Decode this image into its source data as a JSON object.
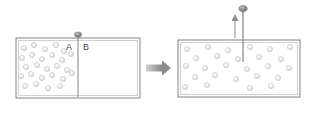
{
  "diagram": {
    "type": "physics-illustration",
    "colors": {
      "box_border": "#8d8d8d",
      "box_inner_border": "#c9c9c9",
      "box_fill": "#ffffff",
      "particle_fill": "#e8e8e8",
      "particle_stroke": "#b0b0b0",
      "divider": "#8d8d8d",
      "knob": "#8a8a8a",
      "arrow": "#9a9a9a",
      "label_text": "#4a4a4a"
    },
    "panels": [
      {
        "id": "before",
        "name": "initial-state",
        "box": {
          "x": 16,
          "y": 38,
          "width": 124,
          "height": 60
        },
        "compartments": [
          {
            "label": "A",
            "label_x": 66,
            "label_y": 43,
            "state": "gas",
            "particle_count": 26
          },
          {
            "label": "B",
            "label_x": 83,
            "label_y": 43,
            "state": "vacuum",
            "particle_count": 0
          }
        ],
        "divider": {
          "x": 78,
          "y_top": 38,
          "y_bottom": 98,
          "knob_x": 78,
          "knob_y": 34
        },
        "particles": [
          {
            "x": 24,
            "y": 48
          },
          {
            "x": 34,
            "y": 45
          },
          {
            "x": 45,
            "y": 49
          },
          {
            "x": 56,
            "y": 45
          },
          {
            "x": 64,
            "y": 51
          },
          {
            "x": 22,
            "y": 58
          },
          {
            "x": 32,
            "y": 55
          },
          {
            "x": 42,
            "y": 59
          },
          {
            "x": 52,
            "y": 55
          },
          {
            "x": 62,
            "y": 60
          },
          {
            "x": 71,
            "y": 54
          },
          {
            "x": 26,
            "y": 67
          },
          {
            "x": 37,
            "y": 65
          },
          {
            "x": 47,
            "y": 69
          },
          {
            "x": 57,
            "y": 66
          },
          {
            "x": 67,
            "y": 70
          },
          {
            "x": 21,
            "y": 76
          },
          {
            "x": 31,
            "y": 74
          },
          {
            "x": 42,
            "y": 78
          },
          {
            "x": 52,
            "y": 75
          },
          {
            "x": 63,
            "y": 79
          },
          {
            "x": 72,
            "y": 73
          },
          {
            "x": 25,
            "y": 86
          },
          {
            "x": 36,
            "y": 84
          },
          {
            "x": 48,
            "y": 88
          },
          {
            "x": 60,
            "y": 86
          }
        ]
      },
      {
        "id": "after",
        "name": "final-state",
        "box": {
          "x": 178,
          "y": 40,
          "width": 122,
          "height": 57
        },
        "compartments": [
          {
            "label": "",
            "state": "gas",
            "particle_count": 26
          }
        ],
        "divider": {
          "x": 243,
          "y_top": 12,
          "y_bottom": 62,
          "knob_x": 243,
          "knob_y": 8,
          "removed": true
        },
        "up_arrow": {
          "x": 235,
          "y_tail": 38,
          "y_head": 16
        },
        "particles": [
          {
            "x": 187,
            "y": 49
          },
          {
            "x": 208,
            "y": 47
          },
          {
            "x": 228,
            "y": 50
          },
          {
            "x": 250,
            "y": 47
          },
          {
            "x": 270,
            "y": 49
          },
          {
            "x": 290,
            "y": 47
          },
          {
            "x": 196,
            "y": 58
          },
          {
            "x": 217,
            "y": 56
          },
          {
            "x": 238,
            "y": 59
          },
          {
            "x": 259,
            "y": 57
          },
          {
            "x": 281,
            "y": 59
          },
          {
            "x": 186,
            "y": 66
          },
          {
            "x": 205,
            "y": 68
          },
          {
            "x": 226,
            "y": 65
          },
          {
            "x": 247,
            "y": 69
          },
          {
            "x": 268,
            "y": 66
          },
          {
            "x": 289,
            "y": 68
          },
          {
            "x": 195,
            "y": 77
          },
          {
            "x": 215,
            "y": 75
          },
          {
            "x": 236,
            "y": 79
          },
          {
            "x": 257,
            "y": 76
          },
          {
            "x": 278,
            "y": 78
          },
          {
            "x": 185,
            "y": 87
          },
          {
            "x": 207,
            "y": 85
          },
          {
            "x": 250,
            "y": 88
          },
          {
            "x": 271,
            "y": 86
          }
        ]
      }
    ],
    "transition_arrow": {
      "name": "process-arrow",
      "direction": "right",
      "x": 146,
      "y": 68,
      "length": 24
    }
  }
}
